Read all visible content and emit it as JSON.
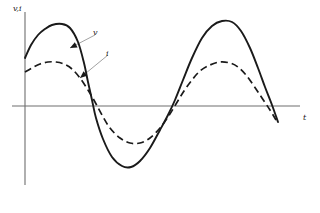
{
  "figure": {
    "axis_labels": {
      "y": "v,i",
      "x": "t"
    },
    "annotations": {
      "v": "v",
      "i": "i"
    },
    "colors": {
      "curve": "#1a1a1a",
      "axis": "#6e6e6e",
      "leader": "#8a8a8a",
      "background": "#ffffff"
    }
  },
  "chart_data": {
    "type": "line",
    "title": "",
    "xlabel": "t",
    "ylabel": "v,i",
    "grid": false,
    "legend_position": "inline-annotation",
    "axis_origin": {
      "x": 25,
      "y": 106
    },
    "x_axis_pixel_range": [
      12,
      300
    ],
    "y_axis_pixel_range": [
      12,
      185
    ],
    "xlim": [
      -0.18,
      2.12
    ],
    "ylim": [
      -1.25,
      1.25
    ],
    "series": [
      {
        "name": "v",
        "label": "v",
        "style": "solid",
        "amplitude": 1.0,
        "period": 1.0,
        "phase_deg": 35,
        "annotation_anchor": [
          95,
          35
        ],
        "annotation_target": [
          70,
          48
        ],
        "points": [
          [
            25,
            58
          ],
          [
            31,
            45
          ],
          [
            38,
            35
          ],
          [
            45,
            29
          ],
          [
            52,
            25
          ],
          [
            62,
            24
          ],
          [
            70,
            28
          ],
          [
            78,
            42
          ],
          [
            84,
            63
          ],
          [
            88,
            82
          ],
          [
            92,
            100
          ],
          [
            96,
            118
          ],
          [
            103,
            139
          ],
          [
            112,
            157
          ],
          [
            122,
            166
          ],
          [
            131,
            167
          ],
          [
            140,
            161
          ],
          [
            150,
            148
          ],
          [
            160,
            130
          ],
          [
            168,
            115
          ],
          [
            175,
            100
          ],
          [
            183,
            80
          ],
          [
            192,
            58
          ],
          [
            202,
            38
          ],
          [
            212,
            26
          ],
          [
            222,
            21
          ],
          [
            232,
            22
          ],
          [
            241,
            31
          ],
          [
            250,
            48
          ],
          [
            258,
            68
          ],
          [
            265,
            87
          ],
          [
            272,
            105
          ],
          [
            278,
            122
          ]
        ]
      },
      {
        "name": "i",
        "label": "i",
        "style": "dashed",
        "amplitude": 0.55,
        "period": 1.0,
        "phase_deg": 25,
        "annotation_anchor": [
          108,
          55
        ],
        "annotation_target": [
          80,
          78
        ],
        "points": [
          [
            25,
            72
          ],
          [
            32,
            68
          ],
          [
            40,
            64
          ],
          [
            48,
            62
          ],
          [
            56,
            62
          ],
          [
            64,
            64
          ],
          [
            72,
            69
          ],
          [
            80,
            78
          ],
          [
            88,
            90
          ],
          [
            95,
            102
          ],
          [
            102,
            115
          ],
          [
            110,
            128
          ],
          [
            120,
            138
          ],
          [
            130,
            143
          ],
          [
            140,
            143
          ],
          [
            150,
            138
          ],
          [
            160,
            128
          ],
          [
            168,
            117
          ],
          [
            176,
            104
          ],
          [
            184,
            91
          ],
          [
            192,
            80
          ],
          [
            200,
            71
          ],
          [
            210,
            65
          ],
          [
            220,
            62
          ],
          [
            230,
            63
          ],
          [
            238,
            67
          ],
          [
            246,
            75
          ],
          [
            254,
            86
          ],
          [
            262,
            98
          ],
          [
            270,
            110
          ],
          [
            276,
            120
          ]
        ]
      }
    ]
  }
}
